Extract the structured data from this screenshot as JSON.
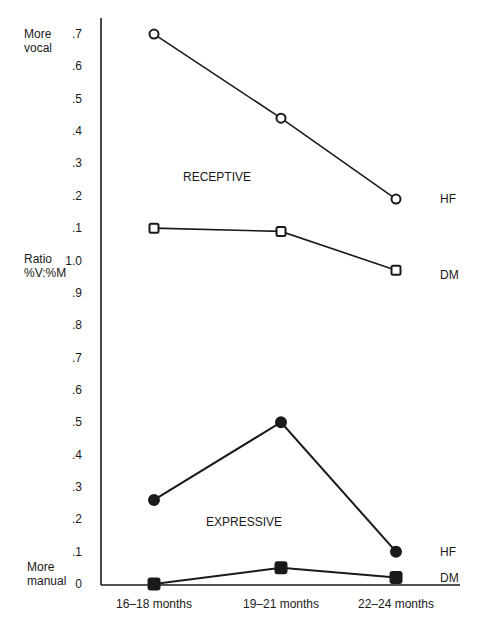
{
  "chart_data": {
    "type": "line",
    "title": "",
    "xlabel": "",
    "ylabel": "Ratio %V:%M",
    "ylabel_top": "More vocal",
    "ylabel_bottom": "More manual",
    "ylim": [
      0,
      1.7
    ],
    "grid": false,
    "legend_position": "inline-right",
    "categories": [
      "16–18 months",
      "19–21 months",
      "22–24 months"
    ],
    "y_tick_labels": [
      "0",
      ".1",
      ".2",
      ".3",
      ".4",
      ".5",
      ".6",
      ".7",
      ".8",
      ".9",
      "1.0",
      ".1",
      ".2",
      ".3",
      ".4",
      ".5",
      ".6",
      ".7"
    ],
    "y_tick_values": [
      0,
      0.1,
      0.2,
      0.3,
      0.4,
      0.5,
      0.6,
      0.7,
      0.8,
      0.9,
      1.0,
      1.1,
      1.2,
      1.3,
      1.4,
      1.5,
      1.6,
      1.7
    ],
    "annotations": [
      {
        "text": "RECEPTIVE",
        "x": "16–18/19–21 months",
        "y": 1.26
      },
      {
        "text": "EXPRESSIVE",
        "x": "16–18/19–21 months",
        "y": 0.2
      }
    ],
    "series": [
      {
        "name": "Receptive HF",
        "group": "RECEPTIVE",
        "end_label": "HF",
        "marker": "open-circle",
        "values": [
          1.7,
          1.44,
          1.19
        ]
      },
      {
        "name": "Receptive DM",
        "group": "RECEPTIVE",
        "end_label": "DM",
        "marker": "open-square",
        "values": [
          1.1,
          1.09,
          0.97
        ]
      },
      {
        "name": "Expressive HF",
        "group": "EXPRESSIVE",
        "end_label": "HF",
        "marker": "filled-circle",
        "values": [
          0.26,
          0.5,
          0.1
        ]
      },
      {
        "name": "Expressive DM",
        "group": "EXPRESSIVE",
        "end_label": "DM",
        "marker": "filled-square",
        "values": [
          0.0,
          0.05,
          0.02
        ]
      }
    ]
  },
  "labels": {
    "more_vocal_1": "More",
    "more_vocal_2": "vocal",
    "ratio_1": "Ratio",
    "ratio_2": "%V:%M",
    "more_manual_1": "More",
    "more_manual_2": "manual",
    "receptive": "RECEPTIVE",
    "expressive": "EXPRESSIVE"
  }
}
